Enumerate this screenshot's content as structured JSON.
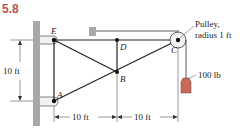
{
  "problem_number": "5.8",
  "points": {
    "A": "A",
    "B": "B",
    "C": "C",
    "D": "D",
    "E": "E"
  },
  "annotations": {
    "pulley_line1": "Pulley,",
    "pulley_line2": "radius 1 ft",
    "load": "100 lb"
  },
  "dimensions": {
    "vertical": "10 ft",
    "horizontal_left": "10 ft",
    "horizontal_right": "10 ft"
  },
  "colors": {
    "accent": "#c0504d",
    "weight": "#c8695c",
    "wall": "#a8a8a8"
  }
}
